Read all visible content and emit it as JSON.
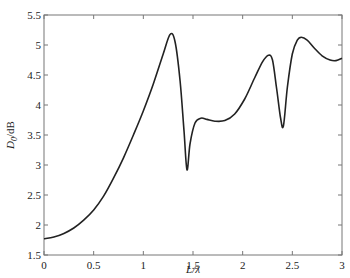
{
  "chart_data": {
    "type": "line",
    "title": "",
    "xlabel": "L/λ",
    "ylabel": "D0/dB",
    "ylabel_main": "D",
    "ylabel_sub": "0",
    "ylabel_unit": "/dB",
    "xlim": [
      0,
      3
    ],
    "ylim": [
      1.5,
      5.5
    ],
    "grid": false,
    "legend": null,
    "x_ticks": [
      "0",
      "0.5",
      "1",
      "1.5",
      "2",
      "2.5",
      "3"
    ],
    "y_ticks": [
      "1.5",
      "2",
      "2.5",
      "3",
      "3.5",
      "4",
      "4.5",
      "5",
      "5.5"
    ],
    "series": [
      {
        "name": "D0",
        "color": "#222222",
        "x": [
          0,
          0.1,
          0.2,
          0.3,
          0.4,
          0.5,
          0.6,
          0.7,
          0.8,
          0.9,
          1.0,
          1.1,
          1.2,
          1.27,
          1.32,
          1.37,
          1.41,
          1.44,
          1.47,
          1.52,
          1.58,
          1.64,
          1.72,
          1.82,
          1.92,
          2.02,
          2.12,
          2.2,
          2.26,
          2.3,
          2.34,
          2.38,
          2.41,
          2.45,
          2.5,
          2.55,
          2.59,
          2.65,
          2.72,
          2.8,
          2.88,
          2.94,
          3.0
        ],
        "values": [
          1.77,
          1.8,
          1.86,
          1.95,
          2.08,
          2.25,
          2.48,
          2.78,
          3.12,
          3.5,
          3.9,
          4.35,
          4.85,
          5.18,
          5.05,
          4.4,
          3.55,
          2.92,
          3.35,
          3.7,
          3.78,
          3.76,
          3.73,
          3.74,
          3.85,
          4.1,
          4.45,
          4.72,
          4.83,
          4.75,
          4.3,
          3.8,
          3.65,
          4.3,
          4.85,
          5.08,
          5.13,
          5.08,
          4.95,
          4.82,
          4.75,
          4.74,
          4.78
        ]
      }
    ]
  }
}
